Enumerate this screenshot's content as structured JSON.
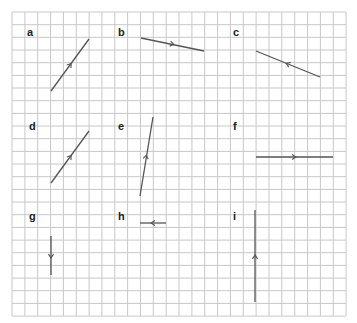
{
  "grid": {
    "x0": 12,
    "y0": 12,
    "x1": 346,
    "y1": 316,
    "spacing_x": 12.85,
    "spacing_y": 12.67,
    "line_color": "#c8c8c8",
    "segment_color": "#555555"
  },
  "panels": [
    {
      "label": "a",
      "label_pos": [
        27,
        27
      ],
      "segment": {
        "from": [
          51,
          91
        ],
        "to": [
          89,
          39
        ]
      },
      "arrow": {
        "at": [
          70,
          65
        ],
        "direction": "up-right"
      }
    },
    {
      "label": "b",
      "label_pos": [
        118,
        27
      ],
      "segment": {
        "from": [
          141,
          38
        ],
        "to": [
          204,
          51
        ]
      },
      "arrow": {
        "at": [
          172,
          44
        ],
        "direction": "right"
      }
    },
    {
      "label": "c",
      "label_pos": [
        233,
        27
      ],
      "segment": {
        "from": [
          256,
          51
        ],
        "to": [
          320,
          77
        ]
      },
      "arrow": {
        "at": [
          288,
          64
        ],
        "direction": "left"
      }
    },
    {
      "label": "d",
      "label_pos": [
        29,
        121
      ],
      "segment": {
        "from": [
          51,
          183
        ],
        "to": [
          89,
          131
        ]
      },
      "arrow": {
        "at": [
          70,
          157
        ],
        "direction": "up-right"
      }
    },
    {
      "label": "e",
      "label_pos": [
        118,
        121
      ],
      "segment": {
        "from": [
          140,
          196
        ],
        "to": [
          153,
          117
        ]
      },
      "arrow": {
        "at": [
          146,
          157
        ],
        "direction": "up"
      }
    },
    {
      "label": "f",
      "label_pos": [
        233,
        121
      ],
      "segment": {
        "from": [
          256,
          157
        ],
        "to": [
          333,
          157
        ]
      },
      "arrow": {
        "at": [
          294,
          157
        ],
        "direction": "right"
      }
    },
    {
      "label": "g",
      "label_pos": [
        29,
        211
      ],
      "segment": {
        "from": [
          51,
          236
        ],
        "to": [
          51,
          275
        ]
      },
      "arrow": {
        "at": [
          51,
          256
        ],
        "direction": "down"
      }
    },
    {
      "label": "h",
      "label_pos": [
        118,
        211
      ],
      "segment": {
        "from": [
          140,
          223
        ],
        "to": [
          166,
          223
        ]
      },
      "arrow": {
        "at": [
          153,
          223
        ],
        "direction": "left"
      }
    },
    {
      "label": "i",
      "label_pos": [
        233,
        211
      ],
      "segment": {
        "from": [
          255,
          210
        ],
        "to": [
          255,
          302
        ]
      },
      "arrow": {
        "at": [
          255,
          257
        ],
        "direction": "up"
      }
    }
  ]
}
